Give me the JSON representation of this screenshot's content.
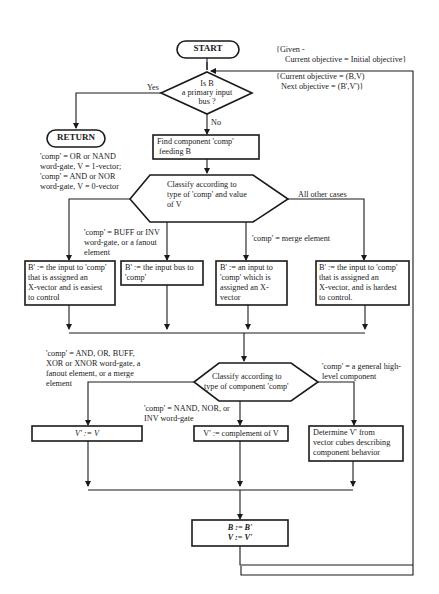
{
  "flowchart": {
    "start": "START",
    "return": "RETURN",
    "annotation_given": {
      "line1": "{Given -",
      "line2": "Current objective = Initial objective}"
    },
    "annotation_objective": {
      "line1": "{Current objective = (B,V)",
      "line2": "Next objective = (B',V')}"
    },
    "decision_primary_input": {
      "line1": "Is B",
      "line2": "a primary input",
      "line3": "bus ?"
    },
    "label_yes": "Yes",
    "label_no": "No",
    "find_component": {
      "line1": "Find  component 'comp'",
      "line2": "feeding B"
    },
    "classify1": {
      "line1": "Classify according to",
      "line2": "type of  'comp' and value",
      "line3": "of V"
    },
    "edge_or_nand": {
      "line1": "'comp' = OR  or NAND",
      "line2": "word-gate, V = 1-vector;",
      "line3": "'comp' = AND or NOR",
      "line4": "word-gate, V = 0-vector"
    },
    "edge_all_other": "All other cases",
    "edge_buff_inv": {
      "line1": "'comp' = BUFF or INV",
      "line2": "word-gate, or a fanout",
      "line3": "element"
    },
    "edge_merge": "'comp' = merge element",
    "box_easiest": {
      "line1": "B' := the input to 'comp'",
      "line2": "that is assigned an",
      "line3": "X-vector and is easiest",
      "line4": "to control"
    },
    "box_input_bus": {
      "line1": "B' := the input bus to",
      "line2": "'comp'"
    },
    "box_an_input": {
      "line1": "B' := an input to",
      "line2": "'comp' which is",
      "line3": "assigned an X-",
      "line4": "vector"
    },
    "box_hardest": {
      "line1": "B' := the input to 'comp'",
      "line2": "that is assigned an",
      "line3": "X-vector, and is hardest",
      "line4": "to control."
    },
    "edge_and_or_buff": {
      "line1": "'comp' = AND, OR, BUFF,",
      "line2": "XOR or XNOR word-gate, a",
      "line3": "fanout element, or a merge",
      "line4": "element"
    },
    "classify2": {
      "line1": "Classify according to",
      "line2": "type of component 'comp'"
    },
    "edge_general": {
      "line1": "'comp' = a general high-",
      "line2": "level component"
    },
    "edge_nand_nor_inv": {
      "line1": "'comp' = NAND, NOR, or",
      "line2": "INV word-gate"
    },
    "box_v_same": "V' := V",
    "box_v_complement": "V' := complement of V",
    "box_determine": {
      "line1": "Determine V' from",
      "line2": "vector cubes describing",
      "line3": "component behavior"
    },
    "box_assign": {
      "line1": "B := B'",
      "line2": "V := V'"
    }
  },
  "colors": {
    "line": "#1a1a1a",
    "background": "#ffffff"
  }
}
